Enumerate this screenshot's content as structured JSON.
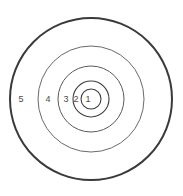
{
  "figure": {
    "type": "concentric-circles-target",
    "background_color": "#ffffff",
    "center": {
      "x": 91,
      "y": 99
    },
    "label_color": "#4a4a4a",
    "label_font_size_px": 9
  },
  "chart_data": {
    "type": "diagram",
    "title": "",
    "subtitle": "",
    "xlabel": "",
    "ylabel": "",
    "legend": [],
    "annotations": [],
    "rings": [
      {
        "label": "1",
        "radius": 10,
        "stroke_color": "#3d3d3d",
        "stroke_width": 1.1,
        "fill": "none",
        "label_x": 88,
        "label_y": 99
      },
      {
        "label": "2",
        "radius": 18,
        "stroke_color": "#3d3d3d",
        "stroke_width": 1.1,
        "fill": "none",
        "label_x": 76,
        "label_y": 99
      },
      {
        "label": "3",
        "radius": 33,
        "stroke_color": "#5a5a5a",
        "stroke_width": 1.0,
        "fill": "none",
        "label_x": 66,
        "label_y": 99
      },
      {
        "label": "4",
        "radius": 53,
        "stroke_color": "#6a6a6a",
        "stroke_width": 1.0,
        "fill": "none",
        "label_x": 48,
        "label_y": 99
      },
      {
        "label": "5",
        "radius": 81,
        "stroke_color": "#3a3a3a",
        "stroke_width": 2.0,
        "fill": "none",
        "label_x": 21,
        "label_y": 99
      }
    ]
  }
}
